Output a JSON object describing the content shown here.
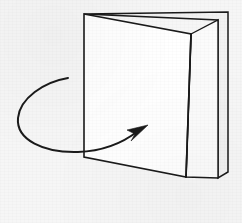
{
  "figure": {
    "caption": "",
    "background_color": "#f6f6f6",
    "stroke_color": "#1a1a1a",
    "canvas": {
      "width": 242,
      "height": 223
    }
  },
  "objects": {
    "front_panel": {
      "name": "front-panel",
      "label": "Front panel of folded card",
      "fill_color": "#ffffff",
      "stroke_color": "#1a1a1a",
      "stroke_width": 1.6,
      "points": "84,14 191,34 186,177 84,157"
    },
    "inner_panel": {
      "name": "inner-panel",
      "label": "Inner panel receding behind fold",
      "fill_color": "#fbfbfb",
      "stroke_color": "#1a1a1a",
      "stroke_width": 1.4,
      "points": "191,34 218,20 218,178 186,177"
    },
    "back_panel": {
      "name": "back-panel",
      "label": "Back panel outline",
      "fill_color": "#f1f1f1",
      "stroke_color": "#1a1a1a",
      "stroke_width": 1.5,
      "points": "84,14 228,12 228,172 218,178 218,20"
    },
    "fold_line": {
      "name": "fold-line",
      "label": "Center fold crease",
      "stroke_color": "#1a1a1a",
      "stroke_width": 1.7,
      "path": "M 191,34 L 186,177"
    },
    "top_edge": {
      "name": "top-edge",
      "label": "Top edge of front panel",
      "path": "M 84,14 L 191,34"
    },
    "bottom_edge": {
      "name": "bottom-edge",
      "label": "Bottom edge of front panel",
      "path": "M 84,157 L 186,177"
    },
    "spine_edge": {
      "name": "spine-edge",
      "label": "Left vertical spine edge",
      "path": "M 84,14 L 84,157"
    }
  },
  "annotations": {
    "rotation_arrow": {
      "name": "rotation-arrow",
      "label": "Rotation direction arrow",
      "description": "Curved arrow sweeping counter-clockwise around the left edge then pointing up-right toward the panel",
      "stroke_color": "#1a1a1a",
      "stroke_width": 2.0,
      "tail_point": [
        68,
        78
      ],
      "tip_point": [
        147,
        126
      ],
      "path": "M 68,78 C 44,82 20,98 18,118 C 16,140 44,153 78,152 C 105,151 124,142 138,131",
      "arrowhead": {
        "name": "arrowhead",
        "fill_color": "#1a1a1a",
        "points": "148,125 127,130 135,134 131,141"
      }
    }
  }
}
